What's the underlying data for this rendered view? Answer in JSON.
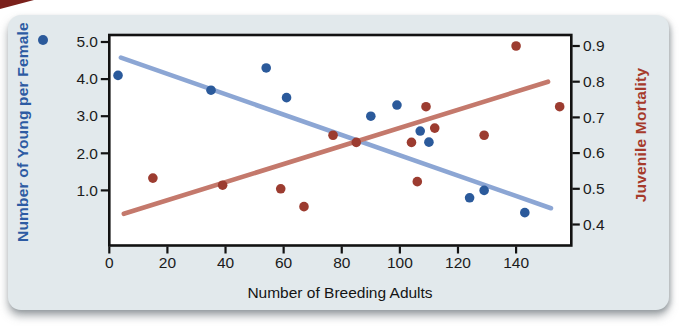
{
  "page": {
    "background": "#ffffff"
  },
  "card": {
    "background": "#e2e9ec",
    "corner_accent_color": "#7a201b"
  },
  "chart_data": {
    "type": "scatter",
    "title": "",
    "xlabel": "Number of Breeding Adults",
    "x_ticks": [
      0,
      20,
      40,
      60,
      80,
      100,
      120,
      140
    ],
    "xlim": [
      0,
      159
    ],
    "grid": false,
    "legend": "none",
    "frame_color": "#121212",
    "plot_background": "#ffffff",
    "left_axis": {
      "label": "Number of Young per Female",
      "color": "#2d5ba3",
      "tick_labels": [
        "5.0",
        "4.0",
        "3.0",
        "2.0",
        "1.0"
      ],
      "tick_values": [
        5.0,
        4.0,
        3.0,
        2.0,
        1.0
      ]
    },
    "right_axis": {
      "label": "Juvenile Mortality",
      "color": "#a63a2b",
      "tick_labels": [
        "0.9",
        "0.8",
        "0.7",
        "0.6",
        "0.5",
        "0.4"
      ],
      "tick_values": [
        0.9,
        0.8,
        0.7,
        0.6,
        0.5,
        0.4
      ]
    },
    "series": [
      {
        "name": "Number of Young per Female",
        "axis": "left",
        "marker_color": "#2b5a9b",
        "trend_color": "#8ca6d4",
        "points": [
          [
            3,
            4.1
          ],
          [
            35,
            3.7
          ],
          [
            54,
            4.3
          ],
          [
            61,
            3.5
          ],
          [
            90,
            3.0
          ],
          [
            99,
            3.3
          ],
          [
            107,
            2.6
          ],
          [
            110,
            2.3
          ],
          [
            124,
            0.8
          ],
          [
            129,
            1.0
          ],
          [
            143,
            0.4
          ]
        ],
        "trend_line": {
          "x": [
            4,
            152
          ],
          "y": [
            4.58,
            0.52
          ]
        }
      },
      {
        "name": "Juvenile Mortality",
        "axis": "right",
        "marker_color": "#9c3c30",
        "trend_color": "#c4796c",
        "points": [
          [
            15,
            0.53
          ],
          [
            39,
            0.51
          ],
          [
            59,
            0.5
          ],
          [
            67,
            0.45
          ],
          [
            77,
            0.65
          ],
          [
            85,
            0.63
          ],
          [
            104,
            0.63
          ],
          [
            106,
            0.52
          ],
          [
            109,
            0.73
          ],
          [
            112,
            0.67
          ],
          [
            129,
            0.65
          ],
          [
            140,
            0.9
          ],
          [
            155,
            0.73
          ]
        ],
        "trend_line": {
          "x": [
            5,
            151
          ],
          "y": [
            0.43,
            0.8
          ]
        }
      }
    ]
  }
}
